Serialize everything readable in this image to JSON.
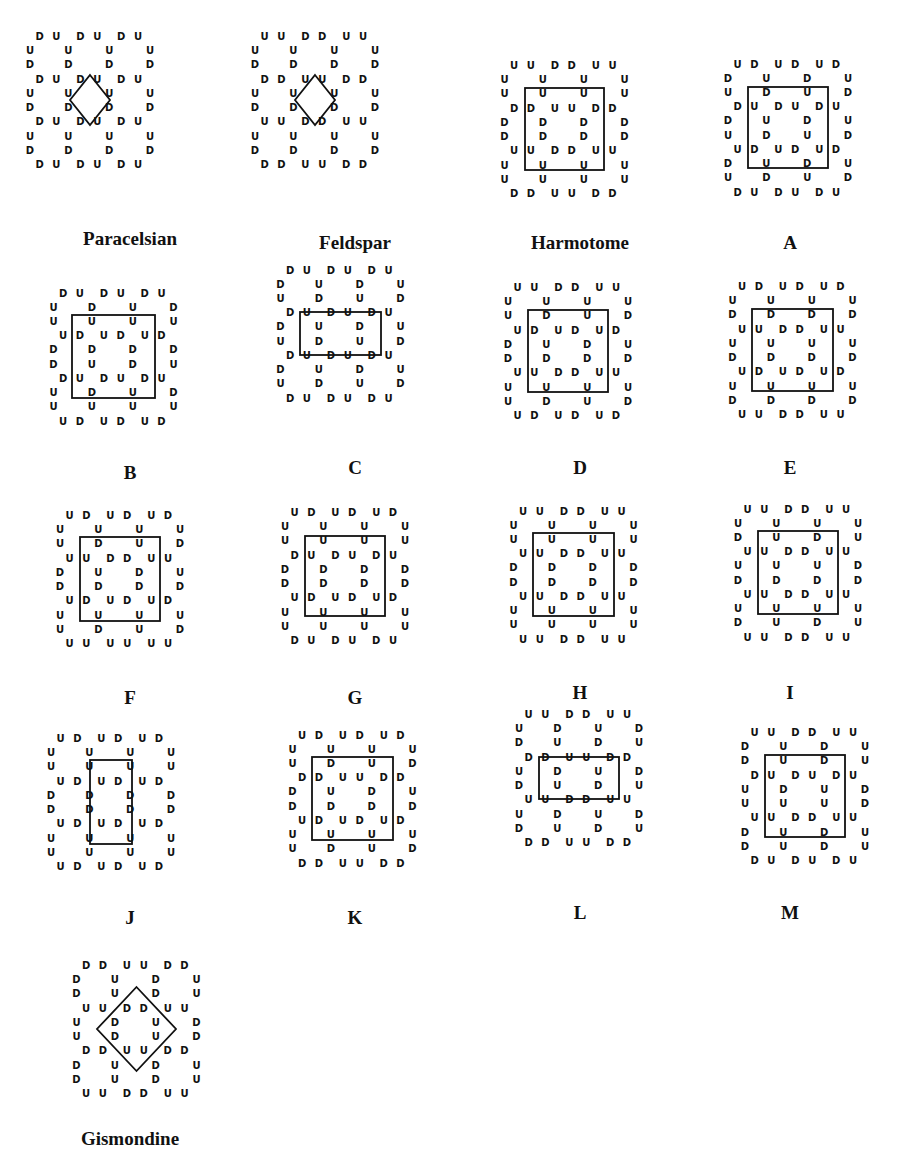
{
  "figure": {
    "diagrams": [
      {
        "id": "paracelsian",
        "label": "Paracelsian",
        "frame": "diamond",
        "pos": [
          30,
          50
        ],
        "frame_box": [
          40,
          25,
          80,
          75
        ],
        "rows": [
          "DUDUDU",
          "UUUU",
          "DDDD",
          "DUDUDU",
          "UUUU",
          "DDDD",
          "DUDUDU",
          "UUUU",
          "DDDD",
          "DUDUDU"
        ]
      },
      {
        "id": "feldspar",
        "label": "Feldspar",
        "frame": "diamond",
        "pos": [
          255,
          50
        ],
        "frame_box": [
          40,
          25,
          80,
          75
        ],
        "rows": [
          "UUDDUU",
          "UUUU",
          "DDDD",
          "DDUUDD",
          "UUUU",
          "DDDD",
          "UUDDUU",
          "UUUU",
          "DDDD",
          "DDUUDD"
        ]
      },
      {
        "id": "harmotome",
        "label": "Harmotome",
        "frame": "square",
        "pos": [
          480,
          50
        ],
        "frame_box": [
          45,
          38,
          124,
          120
        ],
        "rows": [
          "UUDDUU",
          "UUUU",
          "UUUU",
          "DDUUDD",
          "DDDD",
          "DDDD",
          "UUDDUU",
          "UUUU",
          "UUUU",
          "DDUUDD"
        ]
      },
      {
        "id": "A",
        "label": "A",
        "frame": "square",
        "pos": [
          690,
          50
        ],
        "frame_box": [
          58,
          37,
          138,
          118
        ],
        "rows": [
          "UDUDUD",
          "DUDU",
          "UDUD",
          "DUDUDU",
          "DUDU",
          "UDUD",
          "UDUDUD",
          "DUDU",
          "UDUD",
          "DUDUDU"
        ]
      },
      {
        "id": "B",
        "label": "B",
        "frame": "square",
        "pos": [
          30,
          280
        ],
        "frame_box": [
          42,
          35,
          125,
          118
        ],
        "rows": [
          "DUDUDU",
          "UDUD",
          "UUUU",
          "UDUDUD",
          "DDDD",
          "DUDU",
          "DUDUDU",
          "UDUD",
          "UUUU",
          "UDUDUD"
        ]
      },
      {
        "id": "C",
        "label": "C",
        "frame": "rect-wide",
        "pos": [
          255,
          275
        ],
        "frame_box": [
          45,
          37,
          126,
          80
        ],
        "rows": [
          "DUDUDU",
          "DUDU",
          "UDUD",
          "DUDUDU",
          "DUDU",
          "UDUD",
          "DUDUDU",
          "DUDU",
          "UDUD",
          "DUDUDU"
        ]
      },
      {
        "id": "D",
        "label": "D",
        "frame": "square",
        "pos": [
          480,
          275
        ],
        "frame_box": [
          48,
          35,
          128,
          117
        ],
        "rows": [
          "UUDDUU",
          "UUUU",
          "UDUD",
          "UDUDUD",
          "DUDU",
          "DDDD",
          "UUDDUU",
          "UUUU",
          "UDUD",
          "UDUDUD"
        ]
      },
      {
        "id": "E",
        "label": "E",
        "frame": "square",
        "pos": [
          690,
          275
        ],
        "frame_box": [
          62,
          34,
          143,
          116
        ],
        "rows": [
          "UDUDUD",
          "UUUU",
          "DDDD",
          "UUDDUU",
          "UUUU",
          "DDDD",
          "UDUDUD",
          "UUUU",
          "DDDD",
          "UUDDUU"
        ]
      },
      {
        "id": "F",
        "label": "F",
        "frame": "square",
        "pos": [
          30,
          505
        ],
        "frame_box": [
          50,
          32,
          130,
          116
        ],
        "rows": [
          "UDUDUD",
          "UUUU",
          "UDUD",
          "UUDDUU",
          "DUDU",
          "DDDD",
          "UDUDUD",
          "UUUU",
          "UDUD",
          "UUUUUU"
        ]
      },
      {
        "id": "G",
        "label": "G",
        "frame": "square",
        "pos": [
          255,
          505
        ],
        "frame_box": [
          50,
          31,
          130,
          111
        ],
        "rows": [
          "UDUDUD",
          "UUUU",
          "UUUU",
          "DUDUDU",
          "DDDD",
          "DDDD",
          "UDUDUD",
          "UUUU",
          "UUUU",
          "DUDUDU"
        ]
      },
      {
        "id": "H",
        "label": "H",
        "frame": "square",
        "pos": [
          480,
          500
        ],
        "frame_box": [
          53,
          33,
          134,
          116
        ],
        "rows": [
          "UUDDUU",
          "UUUU",
          "UUUU",
          "UUDDUU",
          "DDDD",
          "DDDD",
          "UUDDUU",
          "UUUU",
          "UUUU",
          "UUDDUU"
        ]
      },
      {
        "id": "I",
        "label": "I",
        "frame": "square",
        "pos": [
          690,
          500
        ],
        "frame_box": [
          68,
          31,
          148,
          114
        ],
        "rows": [
          "UUDDUU",
          "UUUU",
          "DUDU",
          "UUDDUU",
          "UUUD",
          "DDDD",
          "UUDDUU",
          "UUUU",
          "DUDU",
          "UUDDUU"
        ]
      },
      {
        "id": "J",
        "label": "J",
        "frame": "rect-tall",
        "pos": [
          30,
          725
        ],
        "frame_box": [
          60,
          35,
          102,
          119
        ],
        "rows": [
          "UDUDUD",
          "UUUU",
          "UUUU",
          "UDUDUD",
          "DDDD",
          "DDDD",
          "UDUDUD",
          "UUUU",
          "UUUU",
          "UDUDUD"
        ]
      },
      {
        "id": "K",
        "label": "K",
        "frame": "square",
        "pos": [
          255,
          725
        ],
        "frame_box": [
          57,
          32,
          138,
          115
        ],
        "rows": [
          "UDUDUD",
          "UUUU",
          "UDUD",
          "DDUUDD",
          "DUDU",
          "DDDD",
          "UDUDUD",
          "UUUU",
          "UDUD",
          "DDUUDD"
        ]
      },
      {
        "id": "L",
        "label": "L",
        "frame": "rect-wide",
        "pos": [
          480,
          720
        ],
        "frame_box": [
          59,
          37,
          139,
          79
        ],
        "rows": [
          "UUDDUU",
          "UDUD",
          "DUDU",
          "DDUUDD",
          "UDUD",
          "DUDU",
          "UUDDUU",
          "UDUD",
          "DUDU",
          "DDUUDD"
        ]
      },
      {
        "id": "M",
        "label": "M",
        "frame": "square",
        "pos": [
          690,
          720
        ],
        "frame_box": [
          75,
          35,
          155,
          117
        ],
        "rows": [
          "UUDDUU",
          "DUDU",
          "DUDU",
          "DUDUDU",
          "UDUD",
          "UUUD",
          "UUDDUU",
          "DUDU",
          "DUDU",
          "DUDUDU"
        ]
      },
      {
        "id": "gismondine",
        "label": "Gismondine",
        "frame": "diamond",
        "pos": [
          30,
          950
        ],
        "frame_box": [
          67,
          37,
          146,
          121
        ],
        "rows": [
          "DDUUDD",
          "DUDU",
          "DUDU",
          "UUDDUU",
          "UDUD",
          "UDUD",
          "DDUUDD",
          "DUDU",
          "DUDU",
          "UUDDUU"
        ]
      }
    ]
  }
}
